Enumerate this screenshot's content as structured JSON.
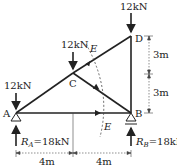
{
  "figure": {
    "type": "truss",
    "nodes": {
      "A": {
        "label": "A"
      },
      "B": {
        "label": "B"
      },
      "C": {
        "label": "C"
      },
      "D": {
        "label": "D"
      }
    },
    "loads": {
      "at_A": "12kN",
      "at_C": "12kN",
      "at_D": "12kN"
    },
    "reactions": {
      "A_sym": "R",
      "A_sub": "A",
      "A_val": "=18kN",
      "B_sym": "R",
      "B_sub": "B",
      "B_val": "=18kN"
    },
    "dimensions": {
      "horizontal_left": "4m",
      "horizontal_right": "4m",
      "vertical_upper": "3m",
      "vertical_lower": "3m"
    },
    "section": {
      "label_top": "E",
      "label_bottom": "E"
    }
  }
}
